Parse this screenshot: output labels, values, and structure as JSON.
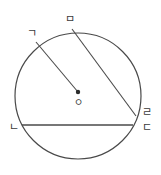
{
  "figure": {
    "type": "circle-geometry-diagram",
    "background_color": "#ffffff",
    "stroke_color": "#4a4a4a",
    "label_color": "#3a3a3a",
    "circle": {
      "name": "main-circle",
      "cx": 78,
      "cy": 96,
      "r": 63,
      "stroke_width": 1.2
    },
    "center_point": {
      "name": "center-dot",
      "x": 78,
      "y": 92,
      "radius": 2.2,
      "label": "ㅇ",
      "label_x": 74,
      "label_y": 98
    },
    "vertices": [
      {
        "id": "g",
        "label": "ㄱ",
        "x": 36,
        "y": 42,
        "label_x": 27,
        "label_y": 28
      },
      {
        "id": "m",
        "label": "ㅁ",
        "x": 72,
        "y": 29,
        "label_x": 65,
        "label_y": 14
      },
      {
        "id": "r",
        "label": "ㄹ",
        "x": 136,
        "y": 116,
        "label_x": 142,
        "label_y": 107
      },
      {
        "id": "d",
        "label": "ㄷ",
        "x": 133,
        "y": 125,
        "label_x": 142,
        "label_y": 122
      },
      {
        "id": "n",
        "label": "ㄴ",
        "x": 22,
        "y": 125,
        "label_x": 9,
        "label_y": 122
      }
    ],
    "segments": [
      {
        "name": "radius-g-to-center",
        "x1": 36,
        "y1": 42,
        "x2": 78,
        "y2": 92,
        "stroke_width": 1.1
      },
      {
        "name": "chord-m-to-r",
        "x1": 72,
        "y1": 29,
        "x2": 136,
        "y2": 116,
        "stroke_width": 1.1
      },
      {
        "name": "chord-n-to-d",
        "x1": 22,
        "y1": 125,
        "x2": 133,
        "y2": 125,
        "stroke_width": 1.3
      }
    ]
  }
}
